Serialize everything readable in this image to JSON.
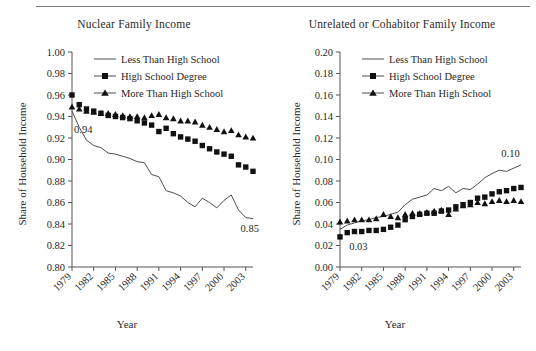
{
  "figure": {
    "has_top_rule": true,
    "background": "#ffffff",
    "ink_color": "#1a1a1a"
  },
  "chart_data": [
    {
      "type": "line",
      "title": "Nuclear Family Income",
      "xlabel": "Year",
      "ylabel": "Share of Household Income",
      "xlim": [
        1979,
        2004
      ],
      "ylim": [
        0.8,
        1.0
      ],
      "ytick_labels": [
        "1.00",
        "0.98",
        "0.96",
        "0.94",
        "0.92",
        "0.90",
        "0.88",
        "0.86",
        "0.84",
        "0.82",
        "0.80"
      ],
      "ytick_values": [
        1.0,
        0.98,
        0.96,
        0.94,
        0.92,
        0.9,
        0.88,
        0.86,
        0.84,
        0.82,
        0.8
      ],
      "xtick_labels": [
        "1979",
        "1982",
        "1985",
        "1988",
        "1991",
        "1994",
        "1997",
        "2000",
        "2003"
      ],
      "xtick_values": [
        1979,
        1982,
        1985,
        1988,
        1991,
        1994,
        1997,
        2000,
        2003
      ],
      "grid": false,
      "legend_position": "top-right-inside",
      "x": [
        1979,
        1980,
        1981,
        1982,
        1983,
        1984,
        1985,
        1986,
        1987,
        1988,
        1989,
        1990,
        1991,
        1992,
        1993,
        1994,
        1995,
        1996,
        1997,
        1998,
        1999,
        2000,
        2001,
        2002,
        2003,
        2004
      ],
      "series": [
        {
          "name": "Less Than High School",
          "marker": "none",
          "values": [
            0.945,
            0.93,
            0.918,
            0.913,
            0.911,
            0.906,
            0.905,
            0.903,
            0.901,
            0.898,
            0.897,
            0.886,
            0.884,
            0.871,
            0.869,
            0.866,
            0.86,
            0.856,
            0.864,
            0.86,
            0.855,
            0.862,
            0.867,
            0.853,
            0.846,
            0.845
          ]
        },
        {
          "name": "High School Degree",
          "marker": "square",
          "values": [
            0.96,
            0.951,
            0.947,
            0.945,
            0.943,
            0.941,
            0.94,
            0.939,
            0.938,
            0.936,
            0.934,
            0.932,
            0.926,
            0.929,
            0.924,
            0.921,
            0.919,
            0.917,
            0.913,
            0.91,
            0.907,
            0.905,
            0.903,
            0.895,
            0.893,
            0.889
          ]
        },
        {
          "name": "More Than High School",
          "marker": "triangle",
          "values": [
            0.949,
            0.947,
            0.945,
            0.944,
            0.943,
            0.943,
            0.942,
            0.941,
            0.94,
            0.94,
            0.939,
            0.941,
            0.942,
            0.939,
            0.938,
            0.936,
            0.936,
            0.935,
            0.932,
            0.93,
            0.928,
            0.926,
            0.927,
            0.923,
            0.921,
            0.92
          ]
        }
      ],
      "annotations": [
        {
          "text": "0.94",
          "x": 1979,
          "y": 0.928
        },
        {
          "text": "0.85",
          "x": 2002,
          "y": 0.836
        }
      ]
    },
    {
      "type": "line",
      "title": "Unrelated or Cohabitor Family Income",
      "xlabel": "Year",
      "ylabel": "Share of Household Income",
      "xlim": [
        1979,
        2004
      ],
      "ylim": [
        0.0,
        0.2
      ],
      "ytick_labels": [
        "0.20",
        "0.18",
        "0.16",
        "0.14",
        "0.12",
        "0.10",
        "0.08",
        "0.06",
        "0.04",
        "0.02",
        "0.00"
      ],
      "ytick_values": [
        0.2,
        0.18,
        0.16,
        0.14,
        0.12,
        0.1,
        0.08,
        0.06,
        0.04,
        0.02,
        0.0
      ],
      "xtick_labels": [
        "1979",
        "1982",
        "1985",
        "1988",
        "1991",
        "1994",
        "1997",
        "2000",
        "2003"
      ],
      "xtick_values": [
        1979,
        1982,
        1985,
        1988,
        1991,
        1994,
        1997,
        2000,
        2003
      ],
      "grid": false,
      "legend_position": "top-right-inside",
      "x": [
        1979,
        1980,
        1981,
        1982,
        1983,
        1984,
        1985,
        1986,
        1987,
        1988,
        1989,
        1990,
        1991,
        1992,
        1993,
        1994,
        1995,
        1996,
        1997,
        1998,
        1999,
        2000,
        2001,
        2002,
        2003,
        2004
      ],
      "series": [
        {
          "name": "Less Than High School",
          "marker": "none",
          "values": [
            0.035,
            0.039,
            0.041,
            0.043,
            0.044,
            0.046,
            0.047,
            0.049,
            0.051,
            0.058,
            0.063,
            0.065,
            0.067,
            0.073,
            0.071,
            0.075,
            0.069,
            0.073,
            0.072,
            0.077,
            0.083,
            0.087,
            0.09,
            0.089,
            0.092,
            0.095
          ]
        },
        {
          "name": "High School Degree",
          "marker": "square",
          "values": [
            0.028,
            0.032,
            0.033,
            0.033,
            0.034,
            0.034,
            0.035,
            0.037,
            0.039,
            0.044,
            0.047,
            0.049,
            0.05,
            0.05,
            0.052,
            0.053,
            0.056,
            0.058,
            0.06,
            0.064,
            0.065,
            0.068,
            0.07,
            0.071,
            0.073,
            0.074
          ]
        },
        {
          "name": "More Than High School",
          "marker": "triangle",
          "values": [
            0.042,
            0.043,
            0.044,
            0.044,
            0.044,
            0.045,
            0.049,
            0.047,
            0.046,
            0.049,
            0.05,
            0.05,
            0.051,
            0.052,
            0.053,
            0.049,
            0.054,
            0.057,
            0.058,
            0.06,
            0.059,
            0.061,
            0.062,
            0.061,
            0.062,
            0.061
          ]
        }
      ],
      "annotations": [
        {
          "text": "0.03",
          "x": 1980,
          "y": 0.019
        },
        {
          "text": "0.10",
          "x": 2001,
          "y": 0.106
        }
      ]
    }
  ]
}
